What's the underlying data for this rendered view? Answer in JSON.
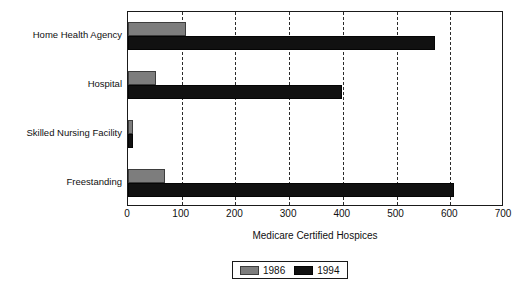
{
  "chart_data": {
    "type": "bar",
    "orientation": "horizontal",
    "title": "",
    "xlabel": "Medicare Certified Hospices",
    "ylabel": "",
    "xlim": [
      0,
      700
    ],
    "xticks": [
      0,
      100,
      200,
      300,
      400,
      500,
      600,
      700
    ],
    "xtick_labels": [
      "0",
      "100",
      "200",
      "300",
      "400",
      "500",
      "600",
      "700"
    ],
    "grid": "vertical-dashed",
    "legend_position": "bottom-center",
    "categories": [
      "Home Health Agency",
      "Hospital",
      "Skilled Nursing Facility",
      "Freestanding"
    ],
    "series": [
      {
        "name": "1986",
        "color": "#7d7d7d",
        "values": [
          108,
          52,
          10,
          69
        ]
      },
      {
        "name": "1994",
        "color": "#111111",
        "values": [
          572,
          399,
          10,
          607
        ]
      }
    ]
  },
  "legend": {
    "entries": [
      {
        "label": "1986",
        "swatch": "legend-swatch-1986"
      },
      {
        "label": "1994",
        "swatch": "legend-swatch-1994"
      }
    ]
  }
}
